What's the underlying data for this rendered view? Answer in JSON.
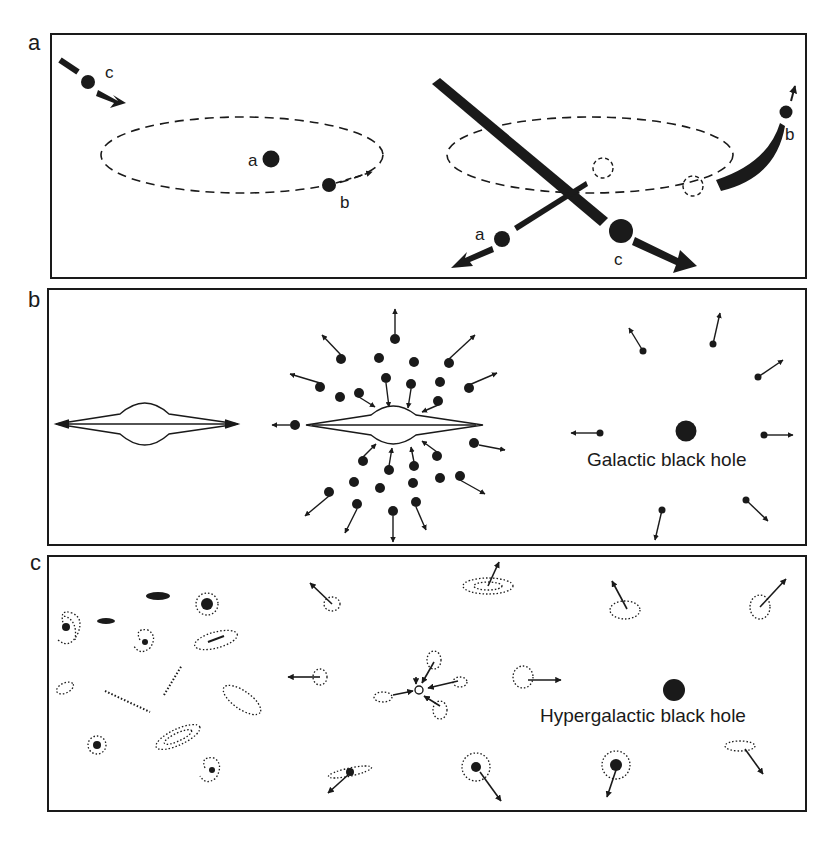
{
  "figure": {
    "panels": [
      {
        "id": "a",
        "label": "a",
        "left_scene": {
          "objects": [
            "a",
            "b",
            "c"
          ],
          "orbit": "dashed ellipse"
        },
        "right_scene": {
          "objects": [
            "a",
            "b",
            "c"
          ],
          "ejected": true
        }
      },
      {
        "id": "b",
        "label": "b",
        "caption_text": "Galactic black hole"
      },
      {
        "id": "c",
        "label": "c",
        "caption_text": "Hypergalactic black hole"
      }
    ],
    "object_labels": {
      "a": "a",
      "b": "b",
      "c": "c"
    },
    "colors": {
      "ink": "#1a1a1a",
      "paper": "#ffffff"
    }
  }
}
